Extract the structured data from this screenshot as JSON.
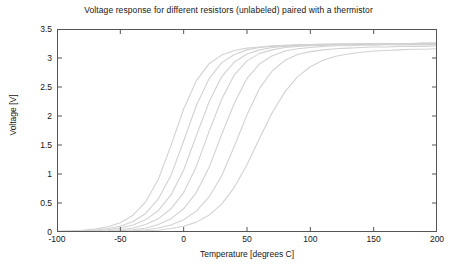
{
  "chart_data": {
    "type": "line",
    "title": "Voltage response for different resistors (unlabeled) paired with a thermistor",
    "xlabel": "Temperature [degrees C]",
    "ylabel": "Voltage [V]",
    "xlim": [
      -100,
      200
    ],
    "ylim": [
      0,
      3.5
    ],
    "xticks": [
      -100,
      -50,
      0,
      50,
      100,
      150,
      200
    ],
    "xtick_labels": [
      "-100",
      "-50",
      "0",
      "50",
      "100",
      "150",
      "200"
    ],
    "yticks": [
      0,
      0.5,
      1,
      1.5,
      2,
      2.5,
      3,
      3.5
    ],
    "ytick_labels": [
      "0",
      "0.5",
      "1",
      "1.5",
      "2",
      "2.5",
      "3",
      "3.5"
    ],
    "grid": false,
    "legend": "none",
    "legend_position": "none",
    "line_color": "#d2d2d2",
    "axis_color": "#555555",
    "background": "#ffffff",
    "x": [
      -100,
      -90,
      -80,
      -70,
      -60,
      -50,
      -40,
      -30,
      -20,
      -10,
      0,
      10,
      20,
      30,
      40,
      50,
      60,
      70,
      80,
      90,
      100,
      110,
      120,
      130,
      140,
      150,
      160,
      170,
      180,
      190,
      200
    ],
    "series": [
      {
        "name": "curve-1",
        "midpoint_c": -12,
        "values": [
          0.01,
          0.02,
          0.03,
          0.05,
          0.09,
          0.16,
          0.29,
          0.52,
          0.91,
          1.49,
          2.12,
          2.61,
          2.9,
          3.05,
          3.13,
          3.17,
          3.19,
          3.21,
          3.22,
          3.23,
          3.23,
          3.24,
          3.24,
          3.24,
          3.25,
          3.25,
          3.25,
          3.25,
          3.25,
          3.26,
          3.26
        ]
      },
      {
        "name": "curve-2",
        "midpoint_c": 5,
        "values": [
          0.01,
          0.01,
          0.02,
          0.03,
          0.06,
          0.1,
          0.18,
          0.32,
          0.57,
          0.98,
          1.57,
          2.18,
          2.64,
          2.92,
          3.06,
          3.14,
          3.18,
          3.2,
          3.21,
          3.22,
          3.23,
          3.23,
          3.24,
          3.24,
          3.24,
          3.25,
          3.25,
          3.25,
          3.25,
          3.25,
          3.25
        ]
      },
      {
        "name": "curve-3",
        "midpoint_c": 22,
        "values": [
          0.0,
          0.01,
          0.01,
          0.02,
          0.04,
          0.07,
          0.12,
          0.21,
          0.37,
          0.64,
          1.07,
          1.66,
          2.24,
          2.68,
          2.93,
          3.07,
          3.14,
          3.18,
          3.2,
          3.21,
          3.22,
          3.23,
          3.23,
          3.24,
          3.24,
          3.24,
          3.24,
          3.25,
          3.25,
          3.25,
          3.25
        ]
      },
      {
        "name": "curve-4",
        "midpoint_c": 41,
        "values": [
          0.0,
          0.0,
          0.01,
          0.01,
          0.02,
          0.04,
          0.07,
          0.13,
          0.23,
          0.4,
          0.68,
          1.13,
          1.73,
          2.29,
          2.71,
          2.95,
          3.08,
          3.14,
          3.18,
          3.2,
          3.21,
          3.22,
          3.23,
          3.23,
          3.23,
          3.24,
          3.24,
          3.24,
          3.24,
          3.24,
          3.25
        ]
      },
      {
        "name": "curve-5",
        "midpoint_c": 63,
        "values": [
          0.0,
          0.0,
          0.0,
          0.01,
          0.01,
          0.02,
          0.04,
          0.07,
          0.13,
          0.23,
          0.4,
          0.68,
          1.11,
          1.68,
          2.22,
          2.65,
          2.9,
          3.04,
          3.12,
          3.16,
          3.18,
          3.2,
          3.21,
          3.21,
          3.22,
          3.22,
          3.23,
          3.23,
          3.23,
          3.23,
          3.23
        ]
      },
      {
        "name": "curve-6",
        "midpoint_c": 90,
        "values": [
          0.0,
          0.0,
          0.0,
          0.0,
          0.01,
          0.01,
          0.02,
          0.04,
          0.07,
          0.12,
          0.21,
          0.36,
          0.6,
          0.97,
          1.48,
          2.02,
          2.48,
          2.78,
          2.96,
          3.06,
          3.11,
          3.14,
          3.16,
          3.17,
          3.18,
          3.19,
          3.19,
          3.2,
          3.2,
          3.2,
          3.21
        ]
      },
      {
        "name": "curve-7",
        "midpoint_c": 122,
        "values": [
          0.0,
          0.0,
          0.0,
          0.0,
          0.0,
          0.01,
          0.01,
          0.02,
          0.03,
          0.06,
          0.1,
          0.17,
          0.29,
          0.48,
          0.77,
          1.16,
          1.62,
          2.06,
          2.42,
          2.68,
          2.85,
          2.96,
          3.03,
          3.07,
          3.1,
          3.12,
          3.13,
          3.14,
          3.15,
          3.15,
          3.16
        ]
      }
    ]
  }
}
